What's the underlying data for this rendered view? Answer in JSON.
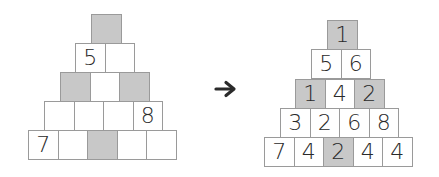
{
  "colors": {
    "shaded": "#c8c8c8",
    "border": "#9a9a9a",
    "text": "#2a2a2a"
  },
  "puzzle": {
    "rows": [
      {
        "cells": [
          {
            "value": "",
            "shaded": true
          }
        ]
      },
      {
        "cells": [
          {
            "value": "5",
            "shaded": false
          },
          {
            "value": "",
            "shaded": false
          }
        ]
      },
      {
        "cells": [
          {
            "value": "",
            "shaded": true
          },
          {
            "value": "",
            "shaded": false
          },
          {
            "value": "",
            "shaded": true
          }
        ]
      },
      {
        "cells": [
          {
            "value": "",
            "shaded": false
          },
          {
            "value": "",
            "shaded": false
          },
          {
            "value": "",
            "shaded": false
          },
          {
            "value": "8",
            "shaded": false
          }
        ]
      },
      {
        "cells": [
          {
            "value": "7",
            "shaded": false
          },
          {
            "value": "",
            "shaded": false
          },
          {
            "value": "",
            "shaded": true
          },
          {
            "value": "",
            "shaded": false
          },
          {
            "value": "",
            "shaded": false
          }
        ]
      }
    ]
  },
  "arrow": {
    "icon": "right-arrow-icon",
    "glyph": "→"
  },
  "solution": {
    "rows": [
      {
        "cells": [
          {
            "value": "1",
            "shaded": true
          }
        ]
      },
      {
        "cells": [
          {
            "value": "5",
            "shaded": false
          },
          {
            "value": "6",
            "shaded": false
          }
        ]
      },
      {
        "cells": [
          {
            "value": "1",
            "shaded": true
          },
          {
            "value": "4",
            "shaded": false
          },
          {
            "value": "2",
            "shaded": true
          }
        ]
      },
      {
        "cells": [
          {
            "value": "3",
            "shaded": false
          },
          {
            "value": "2",
            "shaded": false
          },
          {
            "value": "6",
            "shaded": false
          },
          {
            "value": "8",
            "shaded": false
          }
        ]
      },
      {
        "cells": [
          {
            "value": "7",
            "shaded": false
          },
          {
            "value": "4",
            "shaded": false
          },
          {
            "value": "2",
            "shaded": true
          },
          {
            "value": "4",
            "shaded": false
          },
          {
            "value": "4",
            "shaded": false
          }
        ]
      }
    ]
  }
}
